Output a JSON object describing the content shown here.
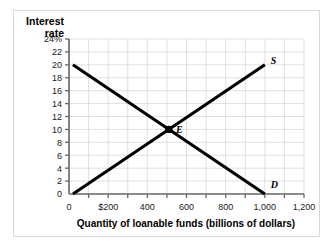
{
  "chart_data": {
    "type": "line",
    "title": "",
    "xlabel": "Quantity of loanable funds (billions of dollars)",
    "ylabel": "Interest rate",
    "ylabel_line1": "Interest",
    "ylabel_line2": "rate",
    "xlim": [
      0,
      1200
    ],
    "ylim": [
      0,
      24
    ],
    "grid": true,
    "grid_x_step": 100,
    "grid_y_step": 2,
    "xticks": [
      0,
      200,
      400,
      600,
      800,
      1000,
      1200
    ],
    "xticklabels": [
      "0",
      "$200",
      "400",
      "600",
      "800",
      "1,000",
      "1,200"
    ],
    "yticks": [
      0,
      2,
      4,
      6,
      8,
      10,
      12,
      14,
      16,
      18,
      20,
      22,
      24
    ],
    "yticklabels": [
      "0",
      "2",
      "4",
      "6",
      "8",
      "10",
      "12",
      "14",
      "16",
      "18",
      "20",
      "22",
      "24%"
    ],
    "series": [
      {
        "name": "D",
        "label": "D",
        "description": "Demand for loanable funds, downward sloping",
        "x": [
          20,
          1000
        ],
        "y": [
          20,
          0
        ],
        "color": "#000000"
      },
      {
        "name": "S",
        "label": "S",
        "description": "Supply of loanable funds, upward sloping",
        "x": [
          20,
          1000
        ],
        "y": [
          0,
          20
        ],
        "color": "#000000"
      }
    ],
    "annotations": [
      {
        "name": "equilibrium-point",
        "label": "E",
        "x": 510,
        "y": 10,
        "marker": "dot"
      }
    ],
    "legend": "none",
    "legend_position": "inline-curve-end"
  },
  "colors": {
    "curve": "#000000",
    "grid": "#d8d8d8",
    "axis": "#555555",
    "frame": "#d9d9d9",
    "text": "#000000",
    "background": "#ffffff"
  }
}
